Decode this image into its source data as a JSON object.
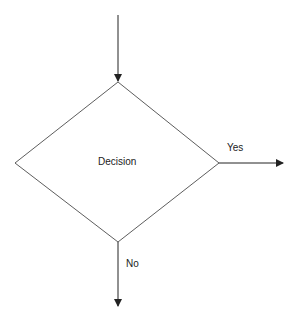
{
  "diagram": {
    "type": "flowchart-decision",
    "decision_label": "Decision",
    "branches": [
      {
        "label": "Yes",
        "direction": "right"
      },
      {
        "label": "No",
        "direction": "down"
      }
    ],
    "colors": {
      "stroke": "#222222",
      "background": "#ffffff",
      "text": "#222222"
    }
  }
}
